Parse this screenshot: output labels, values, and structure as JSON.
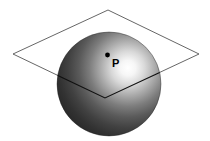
{
  "figure": {
    "background_color": "#ffffff",
    "width": 210,
    "height": 141
  },
  "sphere": {
    "name": "sphere",
    "center_x": 109,
    "center_y": 84,
    "radius": 52,
    "fill_dark": "#2b2b2b",
    "fill_mid": "#555555",
    "fill_light": "#f2f2f2",
    "highlight_x": 128,
    "highlight_y": 68,
    "outline_color": "#1a1a1a"
  },
  "plane": {
    "name": "plane",
    "shape": "parallelogram",
    "stroke_color": "#555555",
    "stroke_width": 0.9,
    "fill": "none",
    "vertices": [
      {
        "label": "top",
        "x": 108,
        "y": 10
      },
      {
        "label": "right",
        "x": 199,
        "y": 54
      },
      {
        "label": "bottom",
        "x": 105,
        "y": 98
      },
      {
        "label": "left",
        "x": 13,
        "y": 54
      }
    ],
    "front_edge_color": "#101010"
  },
  "point": {
    "name": "point-p",
    "label": "P",
    "dot_x": 107.5,
    "dot_y": 55,
    "dot_radius": 2.4,
    "dot_color": "#000000",
    "label_x": 112,
    "label_y": 67,
    "label_color": "#000000"
  }
}
